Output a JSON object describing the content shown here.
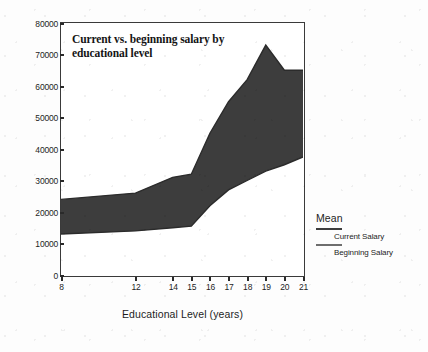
{
  "chart_data": {
    "type": "area",
    "title": "Current vs. beginning salary by educational level",
    "xlabel": "Educational Level (years)",
    "ylabel": "",
    "categories": [
      8,
      12,
      14,
      15,
      16,
      17,
      18,
      19,
      20,
      21
    ],
    "xtick_labels": [
      "8",
      "12",
      "14",
      "15",
      "16",
      "17",
      "18",
      "19",
      "20",
      "21"
    ],
    "ytick_labels": [
      "0",
      "10000",
      "20000",
      "30000",
      "40000",
      "50000",
      "60000",
      "70000",
      "80000"
    ],
    "ytick_values": [
      0,
      10000,
      20000,
      30000,
      40000,
      50000,
      60000,
      70000,
      80000
    ],
    "ylim": [
      0,
      80000
    ],
    "grid": false,
    "legend_position": "right",
    "legend_title": "Mean",
    "series": [
      {
        "name": "Current Salary",
        "values": [
          24000,
          26000,
          31000,
          32000,
          45000,
          55000,
          62000,
          73000,
          65000,
          65000
        ],
        "color": "#3d3d3d"
      },
      {
        "name": "Beginning Salary",
        "values": [
          13000,
          14000,
          15000,
          15500,
          22000,
          27000,
          30000,
          33000,
          35000,
          37500
        ],
        "color": "#3d3d3d"
      }
    ],
    "band_fill_color": "#3d3d3d"
  },
  "legend": {
    "title": "Mean",
    "entries": [
      {
        "label": "Current Salary",
        "swatch": "line-dark"
      },
      {
        "label": "Beginning Salary",
        "swatch": "line-light"
      }
    ]
  }
}
